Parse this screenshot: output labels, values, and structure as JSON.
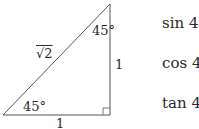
{
  "triangle": {
    "hypotenuse_label": "√2",
    "top_angle_label": "45°",
    "bottom_angle_label": "45°",
    "vertical_side_label": "1",
    "horizontal_side_label": "1",
    "right_angle_marker": "square",
    "stroke_color": "#555555"
  },
  "expressions": [
    {
      "label": "sin 45°"
    },
    {
      "label": "cos 45°"
    },
    {
      "label": "tan 45°"
    }
  ]
}
